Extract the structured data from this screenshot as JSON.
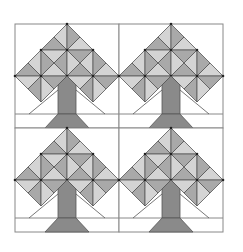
{
  "figure": {
    "title": "",
    "rows": 2,
    "cols": 2,
    "block_size": 104,
    "origin": [
      15,
      24
    ],
    "colors": {
      "background": "#ffffff",
      "outline": "#555555",
      "frame": "#888888",
      "canopy_dark": "#a9a9a9",
      "canopy_light": "#d4d4d4",
      "trunk": "#8a8a8a"
    },
    "blocks": [
      {
        "id": "tree-top-left"
      },
      {
        "id": "tree-top-right"
      },
      {
        "id": "tree-bottom-left"
      },
      {
        "id": "tree-bottom-right"
      }
    ]
  }
}
